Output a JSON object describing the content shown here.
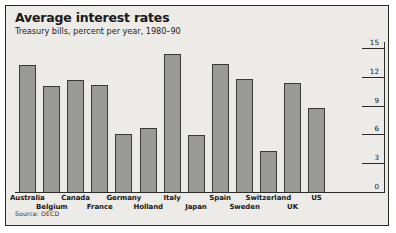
{
  "figure": {
    "title": "Average interest rates",
    "subtitle": "Treasury bills, percent per year, 1980–90",
    "source": "Source: OECD",
    "background": "#ecebe7",
    "bar_fill": "#9a9a95",
    "bar_stroke": "#3a3a38",
    "border": "#2a2a28"
  },
  "chart_data": {
    "type": "bar",
    "title": "Average interest rates",
    "subtitle": "Treasury bills, percent per year, 1980–90",
    "xlabel": "",
    "ylabel": "",
    "ylim": [
      0,
      15
    ],
    "yticks": [
      0,
      3,
      6,
      9,
      12,
      15
    ],
    "ytick_labels": [
      "0",
      "3",
      "6",
      "9",
      "12",
      "15"
    ],
    "axis_position": "right",
    "grid": false,
    "legend": null,
    "source": "Source: OECD",
    "units": "percent per year",
    "period": "1980-90",
    "categories": [
      "Australia",
      "Belgium",
      "Canada",
      "France",
      "Germany",
      "Holland",
      "Italy",
      "Japan",
      "Spain",
      "Sweden",
      "Switzerland",
      "UK",
      "US"
    ],
    "values": [
      13.3,
      11.1,
      11.8,
      11.3,
      6.1,
      6.8,
      14.5,
      6.0,
      13.4,
      11.9,
      4.4,
      11.5,
      8.9
    ],
    "label_rows": [
      0,
      1,
      0,
      1,
      0,
      1,
      0,
      1,
      0,
      1,
      0,
      1,
      0
    ]
  }
}
